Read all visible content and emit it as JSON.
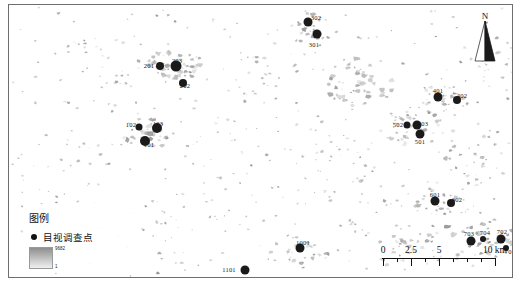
{
  "map": {
    "background_color": "#ffffff",
    "patch_color": "#9a9a9a",
    "point_color": "#1a1a1a",
    "frame_color": "#6e6e6e"
  },
  "north_arrow": {
    "label": "N",
    "icon": "north-arrow-icon"
  },
  "legend": {
    "title": "图例",
    "point_label": "目视调查点",
    "ramp_top_value": "9682",
    "ramp_bottom_value": "1"
  },
  "scalebar": {
    "ticks": [
      "0",
      "2.5",
      "5",
      "10 km"
    ],
    "tick_positions": [
      0,
      25,
      50,
      100
    ],
    "unit": "km"
  },
  "survey_points": [
    {
      "id": "302",
      "x": 299,
      "y": 17,
      "r": 4.5,
      "label_dx": 8,
      "label_dy": -5
    },
    {
      "id": "301",
      "x": 308,
      "y": 29,
      "r": 4.5,
      "label_dx": -3,
      "label_dy": 10
    },
    {
      "id": "201",
      "x": 151,
      "y": 61,
      "r": 4.0,
      "label_dx": -11,
      "label_dy": -1
    },
    {
      "id": "203",
      "x": 167,
      "y": 61,
      "r": 5.5,
      "label_dx": 1,
      "label_dy": -6
    },
    {
      "id": "202",
      "x": 174,
      "y": 78,
      "r": 4.0,
      "label_dx": 2,
      "label_dy": 2
    },
    {
      "id": "401",
      "x": 429,
      "y": 92,
      "r": 4.5,
      "label_dx": 0,
      "label_dy": -7
    },
    {
      "id": "402",
      "x": 448,
      "y": 95,
      "r": 4.0,
      "label_dx": 5,
      "label_dy": -5
    },
    {
      "id": "502",
      "x": 398,
      "y": 120,
      "r": 3.5,
      "label_dx": -9,
      "label_dy": -1
    },
    {
      "id": "503",
      "x": 408,
      "y": 120,
      "r": 4.5,
      "label_dx": 6,
      "label_dy": -2
    },
    {
      "id": "501",
      "x": 411,
      "y": 129,
      "r": 4.5,
      "label_dx": 0,
      "label_dy": 7
    },
    {
      "id": "102",
      "x": 130,
      "y": 122,
      "r": 3.5,
      "label_dx": -8,
      "label_dy": -3
    },
    {
      "id": "103",
      "x": 148,
      "y": 123,
      "r": 5.0,
      "label_dx": 1,
      "label_dy": -5
    },
    {
      "id": "101",
      "x": 136,
      "y": 136,
      "r": 5.0,
      "label_dx": 4,
      "label_dy": 3
    },
    {
      "id": "601",
      "x": 426,
      "y": 196,
      "r": 4.5,
      "label_dx": 0,
      "label_dy": -7
    },
    {
      "id": "602",
      "x": 442,
      "y": 198,
      "r": 4.0,
      "label_dx": 6,
      "label_dy": -4
    },
    {
      "id": "703",
      "x": 462,
      "y": 236,
      "r": 4.5,
      "label_dx": -2,
      "label_dy": -8
    },
    {
      "id": "704",
      "x": 474,
      "y": 234,
      "r": 3.0,
      "label_dx": 2,
      "label_dy": -7
    },
    {
      "id": "702",
      "x": 492,
      "y": 234,
      "r": 4.5,
      "label_dx": 1,
      "label_dy": -8
    },
    {
      "id": "701",
      "x": 497,
      "y": 243,
      "r": 3.0,
      "label_dx": 4,
      "label_dy": 3
    },
    {
      "id": "1001",
      "x": 291,
      "y": 243,
      "r": 4.5,
      "label_dx": 3,
      "label_dy": -6
    },
    {
      "id": "1101",
      "x": 236,
      "y": 265,
      "r": 4.5,
      "label_dx": -16,
      "label_dy": -1
    }
  ],
  "patch_clusters": [
    {
      "cx": 165,
      "cy": 62,
      "rx": 30,
      "ry": 18,
      "n": 48,
      "density": "high"
    },
    {
      "cx": 140,
      "cy": 128,
      "rx": 26,
      "ry": 16,
      "n": 40,
      "density": "high"
    },
    {
      "cx": 303,
      "cy": 24,
      "rx": 22,
      "ry": 16,
      "n": 26,
      "density": "medium"
    },
    {
      "cx": 352,
      "cy": 78,
      "rx": 34,
      "ry": 26,
      "n": 46,
      "density": "high"
    },
    {
      "cx": 405,
      "cy": 122,
      "rx": 30,
      "ry": 20,
      "n": 34,
      "density": "medium"
    },
    {
      "cx": 437,
      "cy": 95,
      "rx": 26,
      "ry": 18,
      "n": 30,
      "density": "medium"
    },
    {
      "cx": 434,
      "cy": 198,
      "rx": 30,
      "ry": 18,
      "n": 28,
      "density": "medium"
    },
    {
      "cx": 470,
      "cy": 236,
      "rx": 40,
      "ry": 22,
      "n": 44,
      "density": "high"
    },
    {
      "cx": 292,
      "cy": 250,
      "rx": 34,
      "ry": 20,
      "n": 30,
      "density": "medium"
    },
    {
      "cx": 410,
      "cy": 248,
      "rx": 46,
      "ry": 20,
      "n": 34,
      "density": "medium"
    },
    {
      "cx": 470,
      "cy": 150,
      "rx": 34,
      "ry": 34,
      "n": 30,
      "density": "medium"
    },
    {
      "cx": 250,
      "cy": 60,
      "rx": 40,
      "ry": 34,
      "n": 22,
      "density": "low"
    },
    {
      "cx": 90,
      "cy": 70,
      "rx": 50,
      "ry": 40,
      "n": 20,
      "density": "low"
    },
    {
      "cx": 60,
      "cy": 170,
      "rx": 50,
      "ry": 45,
      "n": 16,
      "density": "low"
    },
    {
      "cx": 200,
      "cy": 180,
      "rx": 55,
      "ry": 50,
      "n": 18,
      "density": "low"
    },
    {
      "cx": 330,
      "cy": 160,
      "rx": 55,
      "ry": 55,
      "n": 26,
      "density": "low"
    },
    {
      "cx": 380,
      "cy": 200,
      "rx": 45,
      "ry": 40,
      "n": 22,
      "density": "low"
    },
    {
      "cx": 150,
      "cy": 230,
      "rx": 50,
      "ry": 35,
      "n": 14,
      "density": "low"
    },
    {
      "cx": 250,
      "cy": 120,
      "rx": 45,
      "ry": 45,
      "n": 18,
      "density": "low"
    },
    {
      "cx": 480,
      "cy": 60,
      "rx": 30,
      "ry": 40,
      "n": 16,
      "density": "low"
    }
  ]
}
